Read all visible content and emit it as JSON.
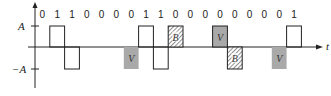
{
  "diagram": {
    "title": "",
    "axis": {
      "y_labels": {
        "pos": "A",
        "neg": "−A"
      },
      "x_label": "t"
    },
    "bits": [
      "0",
      "1",
      "1",
      "0",
      "0",
      "0",
      "0",
      "1",
      "1",
      "0",
      "0",
      "0",
      "0",
      "0",
      "0",
      "0",
      "0",
      "1"
    ],
    "pulses": [
      {
        "index": 1,
        "polarity": 1,
        "type": "mark"
      },
      {
        "index": 2,
        "polarity": -1,
        "type": "mark"
      },
      {
        "index": 6,
        "polarity": -1,
        "type": "V",
        "label": "V"
      },
      {
        "index": 7,
        "polarity": 1,
        "type": "mark"
      },
      {
        "index": 8,
        "polarity": -1,
        "type": "mark"
      },
      {
        "index": 9,
        "polarity": 1,
        "type": "B",
        "label": "B"
      },
      {
        "index": 12,
        "polarity": 1,
        "type": "V",
        "label": "V"
      },
      {
        "index": 13,
        "polarity": -1,
        "type": "B",
        "label": "B"
      },
      {
        "index": 16,
        "polarity": -1,
        "type": "V",
        "label": "V"
      },
      {
        "index": 17,
        "polarity": 1,
        "type": "mark"
      }
    ],
    "colors": {
      "line": "#222222",
      "violation_fill": "#a9a9a9",
      "bipolar_hatch": "#555555"
    }
  }
}
